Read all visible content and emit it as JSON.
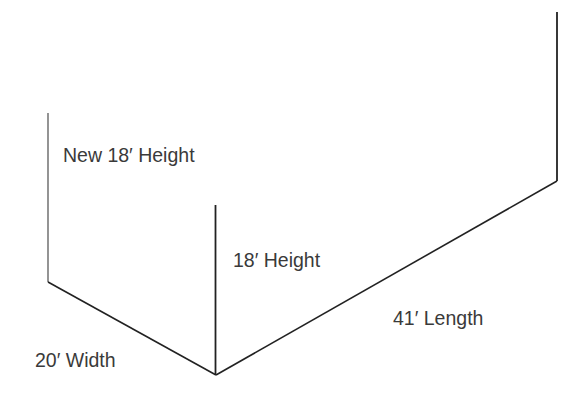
{
  "diagram": {
    "type": "isometric-wall-outline",
    "labels": {
      "new_height": "New 18′ Height",
      "height": "18′ Height",
      "width": "20′ Width",
      "length": "41′ Length"
    },
    "dimensions": {
      "new_height_ft": 18,
      "height_ft": 18,
      "width_ft": 20,
      "length_ft": 41
    },
    "colors": {
      "line": "#222222",
      "new_line": "#666666",
      "text": "#3a3a3a",
      "background": "#ffffff"
    }
  }
}
